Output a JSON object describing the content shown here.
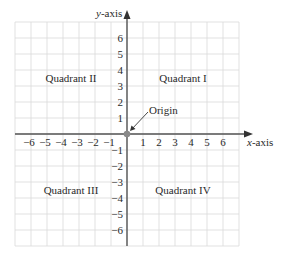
{
  "diagram": {
    "type": "cartesian-coordinate-plane",
    "axes": {
      "x_label": "x-axis",
      "y_label": "y-axis",
      "x_range": [
        -7,
        7
      ],
      "y_range": [
        -7,
        7
      ],
      "x_ticks": [
        "−6",
        "−5",
        "−4",
        "−3",
        "−2",
        "−1",
        "1",
        "2",
        "3",
        "4",
        "5",
        "6"
      ],
      "x_tick_values": [
        -6,
        -5,
        -4,
        -3,
        -2,
        -1,
        1,
        2,
        3,
        4,
        5,
        6
      ],
      "y_ticks_positive": [
        "6",
        "5",
        "4",
        "3",
        "2",
        "1"
      ],
      "y_ticks_negative": [
        "−1",
        "−2",
        "−3",
        "−4",
        "−5",
        "−6"
      ],
      "grid": true
    },
    "quadrants": {
      "q1": "Quadrant I",
      "q2": "Quadrant II",
      "q3": "Quadrant III",
      "q4": "Quadrant IV"
    },
    "origin": {
      "label": "Origin",
      "point": [
        0,
        0
      ]
    },
    "colors": {
      "grid": "#d4d4d4",
      "axis": "#555555",
      "origin_dot": "#8a8a8a",
      "text": "#2a2a2a"
    }
  }
}
